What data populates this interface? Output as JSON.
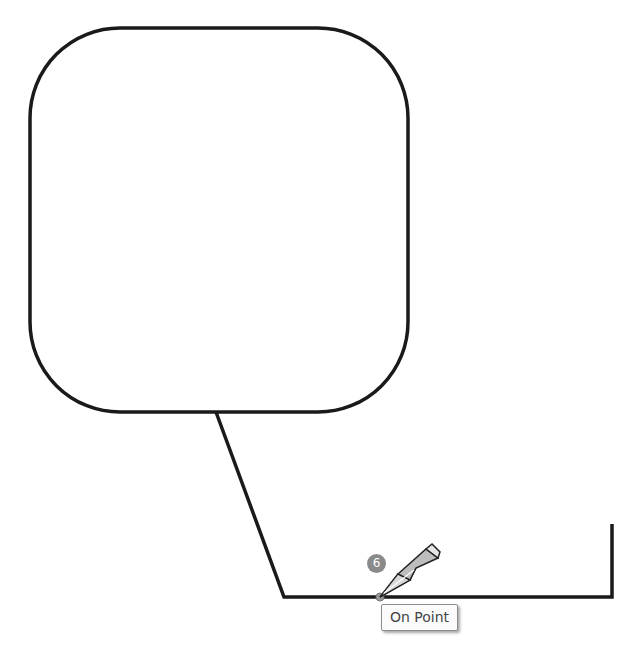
{
  "canvas": {
    "background": "#ffffff",
    "stroke_color": "#1a1a1a",
    "shapes": {
      "rounded_rectangle": {
        "x": 30,
        "y": 28,
        "width": 378,
        "height": 384,
        "corner_radius": 90
      },
      "polyline": [
        [
          216,
          412
        ],
        [
          284,
          597
        ],
        [
          612,
          597
        ],
        [
          612,
          524
        ]
      ]
    }
  },
  "cursor": {
    "icon": "pencil-icon",
    "tip": [
      380,
      597
    ],
    "step_badge": "6",
    "badge_color": "#8a8a8a"
  },
  "tooltip": {
    "label": "On Point"
  }
}
